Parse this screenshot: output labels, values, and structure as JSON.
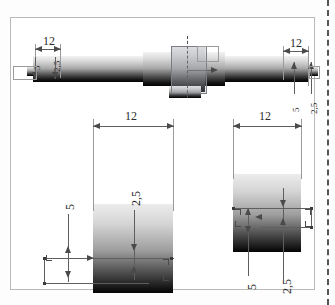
{
  "drawing": {
    "title": "shaft-technical-drawing",
    "units_note": "",
    "decimal_separator": ","
  },
  "top_view": {
    "name": "shaft-elevation-view",
    "dimensions": {
      "left_length": "12",
      "left_height_outer": "5",
      "left_height_inner": "2,5",
      "right_length": "12",
      "right_height_outer": "5",
      "right_height_inner": "2,5"
    }
  },
  "bottom_left_view": {
    "name": "left-detail-view",
    "dimensions": {
      "width": "12",
      "height_outer": "5",
      "height_inner": "2,5"
    }
  },
  "bottom_right_view": {
    "name": "right-detail-view",
    "dimensions": {
      "width": "12",
      "height_outer": "5",
      "height_inner": "2,5"
    }
  },
  "colors": {
    "sheet_border": "#b9b9b9",
    "dimension_line": "#5e5e5e",
    "extension_line": "#9a9a9a",
    "text": "#2b2b2b",
    "selection_fill": "#aaacb9",
    "crop_marker": "#555555"
  }
}
